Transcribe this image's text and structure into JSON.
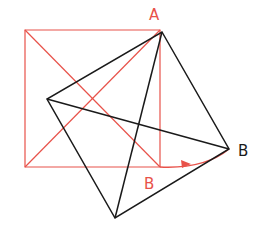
{
  "diagram": {
    "colors": {
      "original": "#e8524a",
      "rotated": "#1a1a1a",
      "background": "#ffffff"
    },
    "labels": {
      "point_a": "A",
      "point_b_original": "B",
      "point_b_rotated": "B"
    },
    "original_square": {
      "description": "red square with both diagonals",
      "vertices": [
        [
          25,
          30
        ],
        [
          160,
          30
        ],
        [
          160,
          167
        ],
        [
          25,
          167
        ]
      ]
    },
    "rotated_square": {
      "description": "black square rotated about vertex A, with both diagonals",
      "vertices": [
        [
          162,
          32
        ],
        [
          229,
          149
        ],
        [
          115,
          218
        ],
        [
          47,
          99
        ]
      ]
    },
    "rotation_arc": {
      "from": [
        160,
        167
      ],
      "to": [
        229,
        149
      ],
      "arrow": "arrowhead-icon"
    }
  }
}
